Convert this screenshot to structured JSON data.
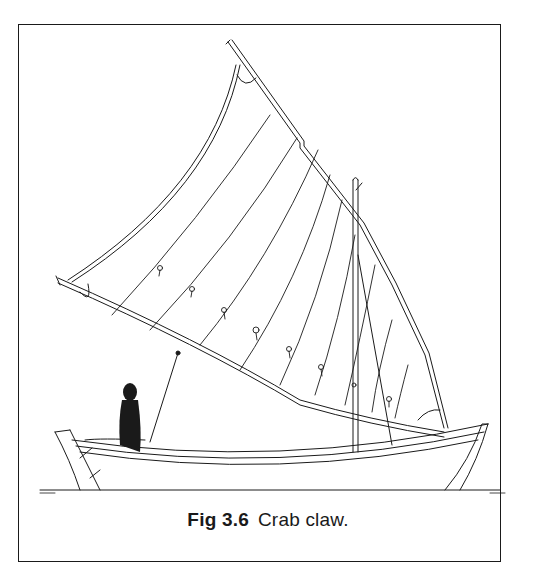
{
  "figure": {
    "label": "Fig 3.6",
    "caption": "Crab claw.",
    "colors": {
      "ink": "#1a1a1a",
      "paper": "#ffffff",
      "frame": "#1a1a1a"
    }
  }
}
